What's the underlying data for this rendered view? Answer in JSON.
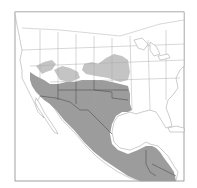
{
  "map": {
    "type": "species-range-map",
    "region": "North America (southern USA, Mexico, Central America)",
    "legend": [
      {
        "label": "",
        "meaning": "primary range",
        "color": "#9c9c9c"
      },
      {
        "label": "",
        "meaning": "peripheral / seasonal range",
        "color": "#c4c4c4"
      }
    ],
    "colors": {
      "background": "#ffffff",
      "frame": "#8a8a8a",
      "land": "#ffffff",
      "boundary_lines": "#a8a8a8",
      "range_main": "#9c9c9c",
      "range_light": "#c4c4c4"
    },
    "range_areas": [
      {
        "name": "southwest-us-mexico-central-america",
        "shade": "main"
      },
      {
        "name": "great-plains-north-extension",
        "shade": "light"
      },
      {
        "name": "great-basin-extension",
        "shade": "light"
      }
    ]
  }
}
